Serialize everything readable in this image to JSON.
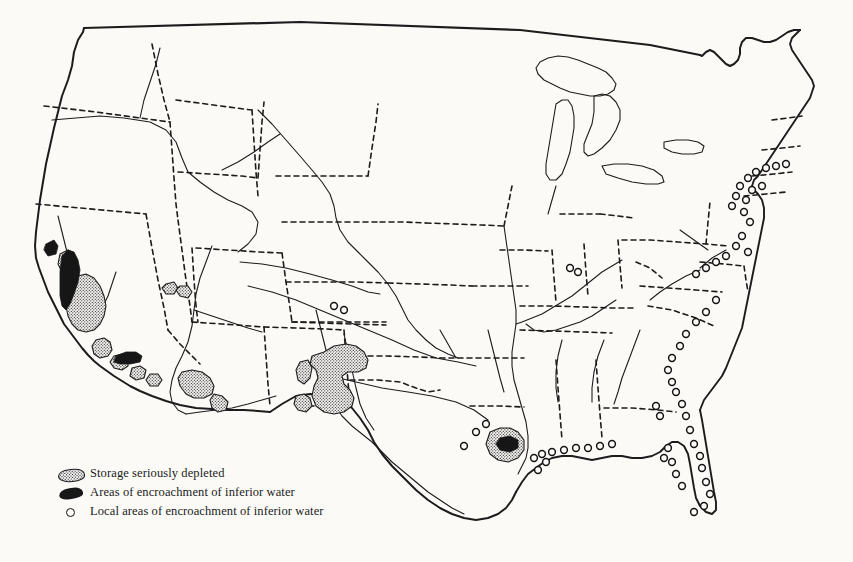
{
  "figure": {
    "kind": "thematic-map",
    "background_color": "#fbfaf7",
    "ink_color": "#1a1a1a"
  },
  "legend": {
    "items": [
      {
        "symbol": "stippled-blob",
        "label": "Storage seriously depleted",
        "fill": "stipple",
        "color": "#efefef"
      },
      {
        "symbol": "solid-blob",
        "label": "Areas of encroachment of inferior water",
        "fill": "solid",
        "color": "#181818"
      },
      {
        "symbol": "small-circle",
        "label": "Local areas of encroachment of inferior water",
        "fill": "open",
        "color": "#111111"
      }
    ]
  },
  "map": {
    "boundary_styles": {
      "national_border": "solid",
      "state_border": "dashed",
      "coastline": "solid",
      "river": "thin-solid",
      "lake": "thin-solid"
    },
    "depleted_regions": [
      "California Central Valley",
      "Southern California inland basins",
      "Arizona Salt and Gila river valleys",
      "West Texas High Plains",
      "Southern New Mexico basins",
      "Houston Gulf Coast"
    ],
    "encroachment_regions": [
      "California coastal Salinas and Santa Clara valleys",
      "Southern California coastal plain",
      "Houston Gulf Coast"
    ],
    "local_encroachment_coasts": [
      "Long Island and New Jersey shore",
      "Delmarva Peninsula",
      "Carolina and Georgia coast",
      "Florida peninsula and Gulf shore",
      "Louisiana, Mississippi and Alabama Gulf Coast",
      "Central Kansas"
    ]
  }
}
